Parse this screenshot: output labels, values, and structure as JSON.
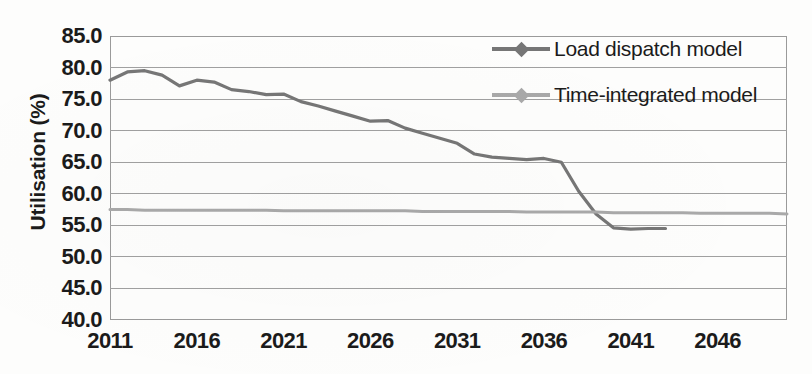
{
  "chart_data": {
    "type": "line",
    "title": "",
    "xlabel": "",
    "ylabel": "Utilisation (%)",
    "ylim": [
      40.0,
      85.0
    ],
    "xlim": [
      2011,
      2050
    ],
    "grid": true,
    "legend_position": "top-right",
    "y_ticks": [
      "85.0",
      "80.0",
      "75.0",
      "70.0",
      "65.0",
      "60.0",
      "55.0",
      "50.0",
      "45.0",
      "40.0"
    ],
    "y_tick_values": [
      85.0,
      80.0,
      75.0,
      70.0,
      65.0,
      60.0,
      55.0,
      50.0,
      45.0,
      40.0
    ],
    "x_ticks": [
      "2011",
      "2016",
      "2021",
      "2026",
      "2031",
      "2036",
      "2041",
      "2046"
    ],
    "x_tick_values": [
      2011,
      2016,
      2021,
      2026,
      2031,
      2036,
      2041,
      2046
    ],
    "colors": {
      "load_dispatch": "#767676",
      "time_integrated": "#a9a9a9",
      "gridline": "#a0a0a0",
      "frame": "#9a9a9a",
      "text": "#1b1b1b"
    },
    "series": [
      {
        "name": "Load dispatch model",
        "color": "#767676",
        "marker": "diamond",
        "x": [
          2011,
          2012,
          2013,
          2014,
          2015,
          2016,
          2017,
          2018,
          2019,
          2020,
          2021,
          2022,
          2023,
          2024,
          2025,
          2026,
          2027,
          2028,
          2029,
          2030,
          2031,
          2032,
          2033,
          2034,
          2035,
          2036,
          2037,
          2038,
          2039,
          2040,
          2041,
          2042,
          2043
        ],
        "values": [
          78.0,
          79.3,
          79.5,
          78.8,
          77.1,
          78.0,
          77.7,
          76.5,
          76.2,
          75.7,
          75.8,
          74.6,
          73.9,
          73.1,
          72.3,
          71.5,
          71.6,
          70.4,
          69.6,
          68.8,
          68.0,
          66.3,
          65.8,
          65.6,
          65.4,
          65.6,
          65.0,
          60.4,
          56.8,
          54.6,
          54.4,
          54.5,
          54.5
        ]
      },
      {
        "name": "Time-integrated model",
        "color": "#a9a9a9",
        "marker": "diamond",
        "x": [
          2011,
          2012,
          2013,
          2014,
          2015,
          2016,
          2017,
          2018,
          2019,
          2020,
          2021,
          2022,
          2023,
          2024,
          2025,
          2026,
          2027,
          2028,
          2029,
          2030,
          2031,
          2032,
          2033,
          2034,
          2035,
          2036,
          2037,
          2038,
          2039,
          2040,
          2041,
          2042,
          2043,
          2044,
          2045,
          2046,
          2047,
          2048,
          2049,
          2050
        ],
        "values": [
          57.5,
          57.5,
          57.4,
          57.4,
          57.4,
          57.4,
          57.4,
          57.4,
          57.4,
          57.4,
          57.3,
          57.3,
          57.3,
          57.3,
          57.3,
          57.3,
          57.3,
          57.3,
          57.2,
          57.2,
          57.2,
          57.2,
          57.2,
          57.2,
          57.1,
          57.1,
          57.1,
          57.1,
          57.1,
          57.0,
          57.0,
          57.0,
          57.0,
          57.0,
          56.9,
          56.9,
          56.9,
          56.9,
          56.9,
          56.8
        ]
      }
    ]
  },
  "legend": {
    "items": [
      {
        "label": "Load dispatch model",
        "color": "#767676"
      },
      {
        "label": "Time-integrated model",
        "color": "#a9a9a9"
      }
    ]
  }
}
